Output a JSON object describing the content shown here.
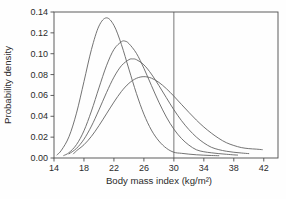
{
  "figure": {
    "xlabel": "Body mass index (kg/m²)",
    "ylabel": "Probability density"
  },
  "colors": {
    "background": "#fefefe",
    "frame": "#4d4d4d",
    "curve": "#636363",
    "reference_line": "#555555",
    "text": "#2b2b2b"
  },
  "chart_data": {
    "type": "line",
    "title": "",
    "xlabel": "Body mass index (kg/m²)",
    "ylabel": "Probability density",
    "xlim": [
      14,
      43.9
    ],
    "ylim": [
      0,
      0.14
    ],
    "x_ticks": [
      14,
      18,
      22,
      26,
      30,
      34,
      38,
      42
    ],
    "x_tick_labels": [
      "14",
      "18",
      "22",
      "26",
      "30",
      "34",
      "38",
      "42"
    ],
    "y_ticks": [
      0.0,
      0.02,
      0.04,
      0.06,
      0.08,
      0.1,
      0.12,
      0.14
    ],
    "y_tick_labels": [
      "0.00",
      "0.02",
      "0.04",
      "0.06",
      "0.08",
      "0.10",
      "0.12",
      "0.14"
    ],
    "grid": false,
    "legend_position": "none",
    "reference_line": {
      "x": 30,
      "orientation": "vertical"
    },
    "series": [
      {
        "name": "bmi-density-curve-1",
        "peak": {
          "x": 21,
          "y": 0.134
        },
        "points": [
          [
            14.4,
            0.003
          ],
          [
            15,
            0.0075
          ],
          [
            16,
            0.0204
          ],
          [
            17,
            0.043
          ],
          [
            18,
            0.0733
          ],
          [
            19,
            0.1041
          ],
          [
            20,
            0.1265
          ],
          [
            21,
            0.1344
          ],
          [
            22,
            0.1272
          ],
          [
            23,
            0.1088
          ],
          [
            24,
            0.0852
          ],
          [
            25,
            0.0619
          ],
          [
            26,
            0.042
          ],
          [
            27,
            0.0268
          ],
          [
            28,
            0.0163
          ],
          [
            29,
            0.0094
          ],
          [
            30,
            0.0055
          ],
          [
            31,
            0.0045
          ],
          [
            32,
            0.0037
          ],
          [
            33,
            0.0031
          ],
          [
            34,
            0.0027
          ],
          [
            35,
            0.0024
          ],
          [
            36,
            0.0022
          ]
        ]
      },
      {
        "name": "bmi-density-curve-2",
        "peak": {
          "x": 23.5,
          "y": 0.112
        },
        "points": [
          [
            15.3,
            0.0024
          ],
          [
            16,
            0.0051
          ],
          [
            17,
            0.0128
          ],
          [
            18,
            0.0261
          ],
          [
            19,
            0.0451
          ],
          [
            20,
            0.0672
          ],
          [
            21,
            0.0884
          ],
          [
            22,
            0.1041
          ],
          [
            23,
            0.1115
          ],
          [
            23.5,
            0.112
          ],
          [
            24,
            0.1097
          ],
          [
            25,
            0.1004
          ],
          [
            26,
            0.086
          ],
          [
            27,
            0.0696
          ],
          [
            28,
            0.0535
          ],
          [
            29,
            0.0393
          ],
          [
            30,
            0.0277
          ],
          [
            31,
            0.0188
          ],
          [
            32,
            0.0124
          ],
          [
            33,
            0.0079
          ],
          [
            34,
            0.006
          ],
          [
            35,
            0.005
          ],
          [
            36,
            0.0042
          ],
          [
            37,
            0.0036
          ],
          [
            38,
            0.003
          ],
          [
            38.5,
            0.0028
          ]
        ]
      },
      {
        "name": "bmi-density-curve-3",
        "peak": {
          "x": 24.5,
          "y": 0.095
        },
        "points": [
          [
            16,
            0.004
          ],
          [
            17,
            0.0092
          ],
          [
            18,
            0.018
          ],
          [
            19,
            0.0306
          ],
          [
            20,
            0.0461
          ],
          [
            21,
            0.0626
          ],
          [
            22,
            0.0775
          ],
          [
            23,
            0.0885
          ],
          [
            24,
            0.0943
          ],
          [
            24.5,
            0.095
          ],
          [
            25,
            0.0943
          ],
          [
            26,
            0.0893
          ],
          [
            27,
            0.0805
          ],
          [
            28,
            0.0695
          ],
          [
            29,
            0.0578
          ],
          [
            30,
            0.0463
          ],
          [
            31,
            0.036
          ],
          [
            32,
            0.0273
          ],
          [
            33,
            0.0201
          ],
          [
            34,
            0.0145
          ],
          [
            35,
            0.0103
          ],
          [
            36,
            0.008
          ],
          [
            37,
            0.0065
          ],
          [
            38,
            0.0055
          ],
          [
            39,
            0.0048
          ],
          [
            40,
            0.0042
          ]
        ]
      },
      {
        "name": "bmi-density-curve-4",
        "peak": {
          "x": 26,
          "y": 0.078
        },
        "points": [
          [
            16.6,
            0.004
          ],
          [
            17,
            0.0069
          ],
          [
            18,
            0.0127
          ],
          [
            19,
            0.0208
          ],
          [
            20,
            0.031
          ],
          [
            21,
            0.0423
          ],
          [
            22,
            0.0536
          ],
          [
            23,
            0.0638
          ],
          [
            24,
            0.0716
          ],
          [
            25,
            0.0764
          ],
          [
            26,
            0.078
          ],
          [
            27,
            0.0766
          ],
          [
            28,
            0.0725
          ],
          [
            29,
            0.0665
          ],
          [
            30,
            0.0593
          ],
          [
            31,
            0.0515
          ],
          [
            32,
            0.0438
          ],
          [
            33,
            0.0364
          ],
          [
            34,
            0.0297
          ],
          [
            35,
            0.0239
          ],
          [
            36,
            0.0188
          ],
          [
            37,
            0.0147
          ],
          [
            38,
            0.012
          ],
          [
            39,
            0.01
          ],
          [
            40,
            0.009
          ],
          [
            41,
            0.0085
          ],
          [
            41.8,
            0.008
          ]
        ]
      }
    ]
  }
}
